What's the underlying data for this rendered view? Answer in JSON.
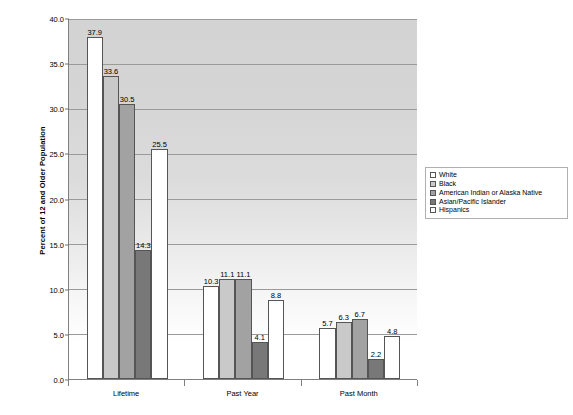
{
  "chart_data": {
    "type": "bar",
    "title": "",
    "subtitle": "",
    "xlabel": "",
    "ylabel": "Percent of 12 and Older Population",
    "ylim": [
      0.0,
      40.0
    ],
    "ytick_step": 5.0,
    "ytick_labels": [
      "0.0",
      "5.0",
      "10.0",
      "15.0",
      "20.0",
      "25.0",
      "30.0",
      "35.0",
      "40.0"
    ],
    "ytick_values": [
      0.0,
      5.0,
      10.0,
      15.0,
      20.0,
      25.0,
      30.0,
      35.0,
      40.0
    ],
    "grid": true,
    "legend_position": "right",
    "categories": [
      "Lifetime",
      "Past Year",
      "Past Month"
    ],
    "series": [
      {
        "name": "White",
        "color": "#ffffff",
        "values": [
          37.9,
          10.3,
          5.7
        ]
      },
      {
        "name": "Black",
        "color": "#c9c9c9",
        "values": [
          33.6,
          11.1,
          6.3
        ]
      },
      {
        "name": "American Indian or Alaska Native",
        "color": "#a2a2a2",
        "values": [
          30.5,
          11.1,
          6.7
        ]
      },
      {
        "name": "Asian/Pacific Islander",
        "color": "#787878",
        "values": [
          14.3,
          4.1,
          2.2
        ]
      },
      {
        "name": "Hispanics",
        "color": "#ffffff",
        "values": [
          25.5,
          8.8,
          4.8
        ]
      }
    ],
    "data_labels": [
      [
        "37.9",
        "33.6",
        "30.5",
        "14.3",
        "25.5"
      ],
      [
        "10.3",
        "11.1",
        "11.1",
        "4.1",
        "8.8"
      ],
      [
        "5.7",
        "6.3",
        "6.7",
        "2.2",
        "4.8"
      ]
    ]
  },
  "legend": {
    "items": [
      {
        "label": "White"
      },
      {
        "label": "Black"
      },
      {
        "label": "American Indian or Alaska Native"
      },
      {
        "label": "Asian/Pacific Islander"
      },
      {
        "label": "Hispanics"
      }
    ]
  }
}
